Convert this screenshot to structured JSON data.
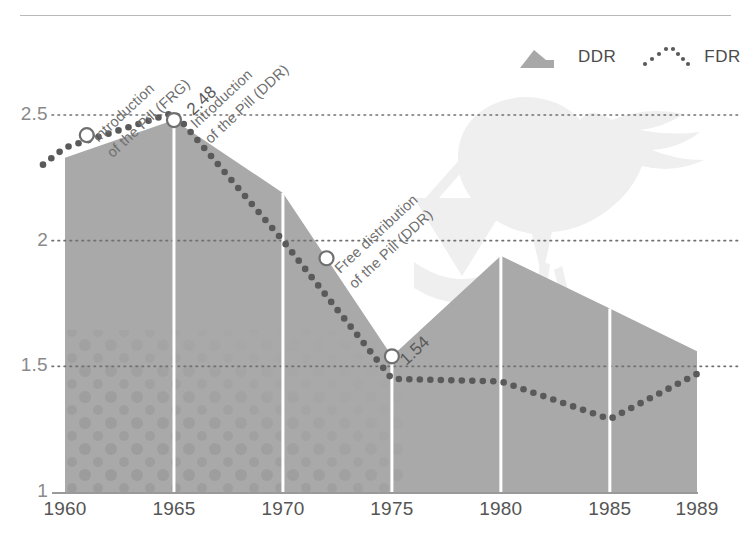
{
  "figure": {
    "background": "#ffffff",
    "rule_color": "#b9b9b9",
    "watermark": "stork-carrying-baby-bundle"
  },
  "legend": {
    "position": "top-right",
    "items": [
      {
        "label": "DDR",
        "style": "area",
        "color": "#a8a8a8",
        "icon": "area-swatch-icon"
      },
      {
        "label": "FDR",
        "style": "dotted-line",
        "color": "#5a5a5a",
        "icon": "dotted-line-swatch-icon"
      }
    ]
  },
  "annotations": [
    {
      "id": "intro-pill-frg",
      "text": "Introduction\nof the Pill (FRG)",
      "marker_year": 1961,
      "marker_value": 2.42
    },
    {
      "id": "intro-pill-ddr",
      "text": "Introduction\nof the Pill (DDR)",
      "marker_year": 1965,
      "marker_value": 2.48
    },
    {
      "id": "free-distribution-ddr",
      "text": "Free distribution\nof the Pill (DDR)",
      "marker_year": 1972,
      "marker_value": 1.93
    }
  ],
  "value_labels": [
    {
      "id": "peak-1965",
      "text": "2.48",
      "year": 1965,
      "value": 2.48
    },
    {
      "id": "trough-1975",
      "text": "1.54",
      "year": 1975,
      "value": 1.54
    }
  ],
  "chart_data": {
    "type": "area",
    "title": "",
    "subtitle": "",
    "xlabel": "",
    "ylabel": "",
    "xlim": [
      1960,
      1989
    ],
    "ylim": [
      1,
      2.5
    ],
    "grid": true,
    "gridlines_y": [
      1.5,
      2.0,
      2.5
    ],
    "gridlines_x": [
      1965,
      1970,
      1975,
      1980,
      1985
    ],
    "xticks": [
      "1960",
      "1965",
      "1970",
      "1975",
      "1980",
      "1985",
      "1989"
    ],
    "xtick_values": [
      1960,
      1965,
      1970,
      1975,
      1980,
      1985,
      1989
    ],
    "yticks": [
      "1",
      "1.5",
      "2",
      "2.5"
    ],
    "ytick_values": [
      1,
      1.5,
      2,
      2.5
    ],
    "legend_position": "top-right",
    "x": [
      1960,
      1965,
      1970,
      1975,
      1980,
      1985,
      1989
    ],
    "series": [
      {
        "name": "DDR",
        "type": "area",
        "color": "#a8a8a8",
        "values": [
          2.33,
          2.48,
          2.19,
          1.54,
          1.94,
          1.73,
          1.56
        ]
      },
      {
        "name": "FDR",
        "type": "dotted-line",
        "color": "#5a5a5a",
        "values": [
          2.37,
          2.51,
          2.0,
          1.45,
          1.44,
          1.29,
          1.47
        ]
      }
    ]
  }
}
